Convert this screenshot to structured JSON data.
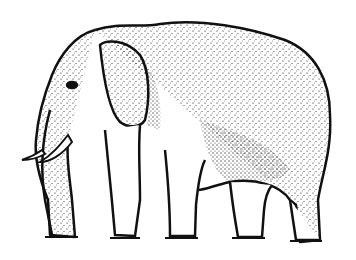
{
  "image": {
    "subject": "Impossible elephant optical illusion",
    "description": "Black-and-white stippled line drawing of an elephant with ambiguous legs",
    "colors": {
      "ink": "#111111",
      "background": "#ffffff"
    }
  }
}
